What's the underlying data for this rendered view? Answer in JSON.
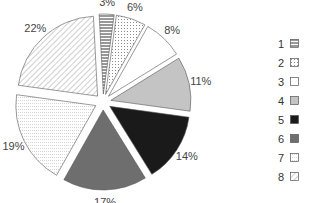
{
  "chart_data": {
    "type": "pie",
    "exploded": true,
    "title": "",
    "legend_position": "right",
    "slices": [
      {
        "label": "1",
        "value": 3,
        "text": "3%",
        "fill": "hlines",
        "color": "#333333"
      },
      {
        "label": "2",
        "value": 6,
        "text": "6%",
        "fill": "dots",
        "color": "#888888"
      },
      {
        "label": "3",
        "value": 8,
        "text": "8%",
        "fill": "white",
        "color": "#ffffff"
      },
      {
        "label": "4",
        "value": 11,
        "text": "11%",
        "fill": "light-gray",
        "color": "#c4c4c4"
      },
      {
        "label": "5",
        "value": 14,
        "text": "14%",
        "fill": "black",
        "color": "#1a1a1a"
      },
      {
        "label": "6",
        "value": 17,
        "text": "17%",
        "fill": "dark-gray",
        "color": "#6e6e6e"
      },
      {
        "label": "7",
        "value": 19,
        "text": "19%",
        "fill": "dotted-lines",
        "color": "#bbbbbb"
      },
      {
        "label": "8",
        "value": 22,
        "text": "22%",
        "fill": "diagonal",
        "color": "#888888"
      }
    ]
  },
  "legend": {
    "items": [
      "1",
      "2",
      "3",
      "4",
      "5",
      "6",
      "7",
      "8"
    ]
  }
}
